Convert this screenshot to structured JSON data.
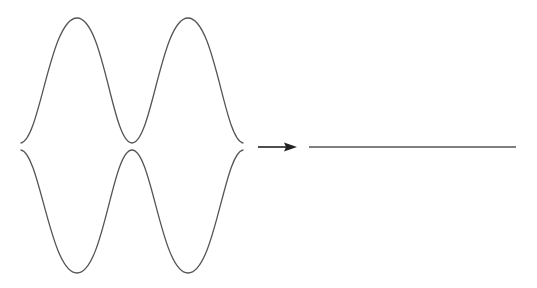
{
  "diagram": {
    "description": "Two mirrored wave envelopes (upper and lower) transform into a flat line",
    "colors": {
      "background": "#ffffff",
      "wave_stroke": "#555555",
      "arrow": "#222222",
      "flat_line": "#555555"
    },
    "upper_wave": {
      "label": "upper-wave",
      "points": [
        [
          21,
          143
        ],
        [
          77,
          18
        ],
        [
          132,
          143
        ],
        [
          188,
          18
        ],
        [
          243,
          143
        ]
      ]
    },
    "lower_wave": {
      "label": "lower-wave",
      "points": [
        [
          21,
          150
        ],
        [
          77,
          273
        ],
        [
          132,
          150
        ],
        [
          188,
          273
        ],
        [
          243,
          150
        ]
      ]
    },
    "arrow": {
      "label": "transform-arrow",
      "from": [
        258,
        147
      ],
      "to": [
        297,
        147
      ],
      "direction": "right"
    },
    "result_line": {
      "label": "flat-line",
      "from": [
        309,
        147
      ],
      "to": [
        516,
        147
      ]
    }
  }
}
